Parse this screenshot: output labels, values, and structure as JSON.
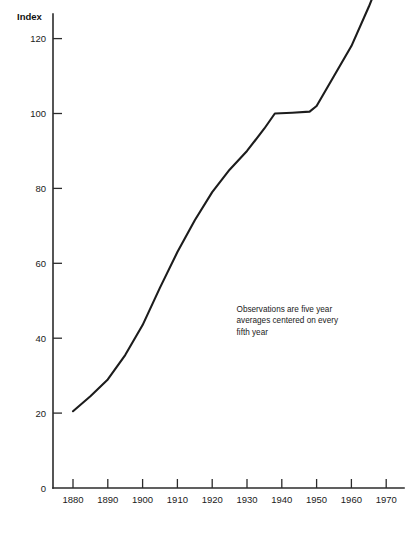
{
  "chart_data": {
    "type": "line",
    "title": "",
    "subtitle": "",
    "xlabel": "",
    "ylabel": "Index",
    "xlim": [
      1875,
      1970
    ],
    "ylim": [
      0,
      145
    ],
    "grid": false,
    "legend": null,
    "x_ticks": [
      "1880",
      "1890",
      "1900",
      "1910",
      "1920",
      "1930",
      "1940",
      "1950",
      "1960",
      "1970"
    ],
    "y_ticks": [
      "0",
      "20",
      "40",
      "60",
      "80",
      "100",
      "120"
    ],
    "origin_label": "0",
    "annotations": [
      {
        "name": "observations-note",
        "lines": [
          "Observations are five year",
          "averages centered on every",
          "fifth year"
        ],
        "x": 1927,
        "y": 47
      }
    ],
    "series": [
      {
        "name": "Index",
        "color": "#1c1c1c",
        "x": [
          1880,
          1885,
          1890,
          1895,
          1900,
          1905,
          1910,
          1915,
          1920,
          1925,
          1930,
          1935,
          1938,
          1943,
          1948,
          1950,
          1955,
          1960,
          1965,
          1970
        ],
        "values": [
          20.5,
          24.5,
          29.0,
          35.5,
          43.5,
          53.5,
          63.0,
          71.5,
          79.0,
          85.0,
          90.0,
          96.0,
          100.0,
          100.2,
          100.5,
          102.0,
          110.0,
          118.0,
          128.5,
          140.0
        ]
      }
    ]
  },
  "axis": {
    "y_title": "Index"
  }
}
